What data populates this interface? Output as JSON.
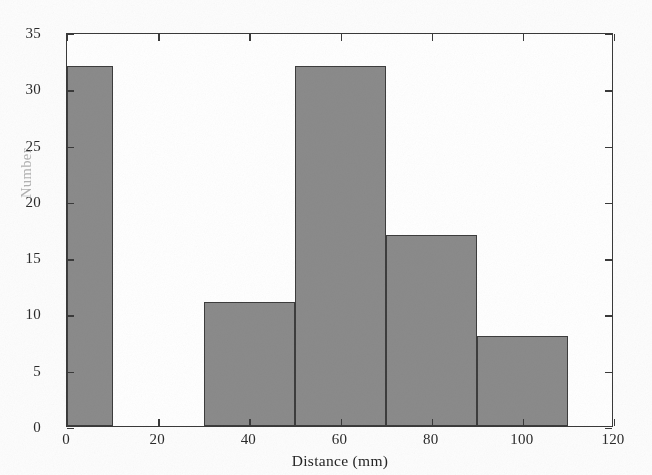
{
  "figure": {
    "background_color": "#fdfdfd",
    "axis_color": "#3a3a3a",
    "bar_fill_color": "#8b8b8b",
    "bar_edge_color": "#3d3d3d",
    "ylabel_color": "#b2b2b2"
  },
  "chart_data": {
    "type": "bar",
    "title": "",
    "subtitle": "",
    "xlabel": "Distance (mm)",
    "ylabel": "Number",
    "xlim": [
      0,
      120
    ],
    "ylim": [
      0,
      35
    ],
    "grid": false,
    "legend": null,
    "bin_width": 10,
    "xticks": [
      0,
      20,
      40,
      60,
      80,
      100,
      120
    ],
    "xtick_labels": [
      "0",
      "20",
      "40",
      "60",
      "80",
      "100",
      "120"
    ],
    "yticks": [
      0,
      5,
      10,
      15,
      20,
      25,
      30,
      35
    ],
    "ytick_labels": [
      "0",
      "5",
      "10",
      "15",
      "20",
      "25",
      "30",
      "35"
    ],
    "bins": [
      {
        "x0": 0,
        "x1": 10,
        "value": 32
      },
      {
        "x0": 10,
        "x1": 20,
        "value": 0
      },
      {
        "x0": 20,
        "x1": 30,
        "value": 0
      },
      {
        "x0": 30,
        "x1": 40,
        "value": 11
      },
      {
        "x0": 40,
        "x1": 50,
        "value": 11
      },
      {
        "x0": 50,
        "x1": 60,
        "value": 32
      },
      {
        "x0": 60,
        "x1": 70,
        "value": 32
      },
      {
        "x0": 70,
        "x1": 80,
        "value": 17
      },
      {
        "x0": 80,
        "x1": 90,
        "value": 17
      },
      {
        "x0": 90,
        "x1": 100,
        "value": 8
      },
      {
        "x0": 100,
        "x1": 110,
        "value": 8
      },
      {
        "x0": 110,
        "x1": 120,
        "value": 0
      }
    ],
    "categories": [
      "0-10",
      "10-20",
      "20-30",
      "30-40",
      "40-50",
      "50-60",
      "60-70",
      "70-80",
      "80-90",
      "90-100",
      "100-110",
      "110-120"
    ],
    "values": [
      32,
      0,
      0,
      11,
      11,
      32,
      32,
      17,
      17,
      8,
      8,
      0
    ],
    "drawn_rectangles": [
      {
        "x0": 0,
        "x1": 10,
        "value": 32
      },
      {
        "x0": 30,
        "x1": 50,
        "value": 11
      },
      {
        "x0": 50,
        "x1": 70,
        "value": 32
      },
      {
        "x0": 70,
        "x1": 90,
        "value": 17
      },
      {
        "x0": 90,
        "x1": 110,
        "value": 8
      }
    ]
  }
}
